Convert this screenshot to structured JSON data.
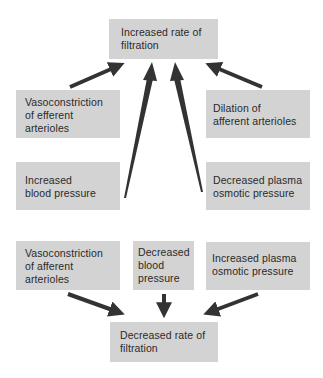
{
  "diagram": {
    "top": {
      "lines": [
        "Increased rate of",
        "filtration"
      ]
    },
    "increase_causes": [
      {
        "id": "vaso-efferent",
        "lines": [
          "Vasoconstriction",
          "of efferent",
          "arterioles"
        ]
      },
      {
        "id": "dilation-afferent",
        "lines": [
          "Dilation of",
          "afferent arterioles"
        ]
      },
      {
        "id": "increased-bp",
        "lines": [
          "Increased",
          "blood pressure"
        ]
      },
      {
        "id": "decreased-osmotic",
        "lines": [
          "Decreased plasma",
          "osmotic pressure"
        ]
      }
    ],
    "decrease_causes": [
      {
        "id": "vaso-afferent",
        "lines": [
          "Vasoconstriction",
          "of afferent",
          "arterioles"
        ]
      },
      {
        "id": "decreased-bp",
        "lines": [
          "Decreased",
          "blood",
          "pressure"
        ]
      },
      {
        "id": "increased-osmotic",
        "lines": [
          "Increased plasma",
          "osmotic pressure"
        ]
      }
    ],
    "bottom": {
      "lines": [
        "Decreased rate of",
        "filtration"
      ]
    },
    "colors": {
      "box_fill": "#d3d3d3",
      "arrow": "#333333",
      "text": "#2a2a2a"
    }
  }
}
